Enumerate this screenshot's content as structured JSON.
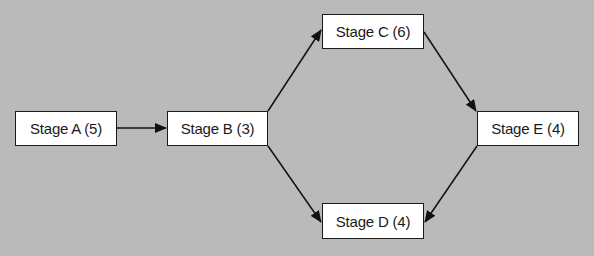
{
  "diagram": {
    "type": "flowchart",
    "background": "#bababa",
    "nodes": [
      {
        "id": "A",
        "label": "Stage A (5)",
        "x": 15,
        "y": 111,
        "w": 102,
        "h": 35
      },
      {
        "id": "B",
        "label": "Stage B (3)",
        "x": 167,
        "y": 111,
        "w": 101,
        "h": 35
      },
      {
        "id": "C",
        "label": "Stage C (6)",
        "x": 322,
        "y": 14,
        "w": 102,
        "h": 35
      },
      {
        "id": "D",
        "label": "Stage D (4)",
        "x": 322,
        "y": 203,
        "w": 102,
        "h": 36
      },
      {
        "id": "E",
        "label": "Stage E (4)",
        "x": 477,
        "y": 111,
        "w": 102,
        "h": 35
      }
    ],
    "edges": [
      {
        "from": "A",
        "to": "B"
      },
      {
        "from": "B",
        "to": "C"
      },
      {
        "from": "B",
        "to": "D"
      },
      {
        "from": "C",
        "to": "E"
      },
      {
        "from": "E",
        "to": "D"
      }
    ]
  }
}
